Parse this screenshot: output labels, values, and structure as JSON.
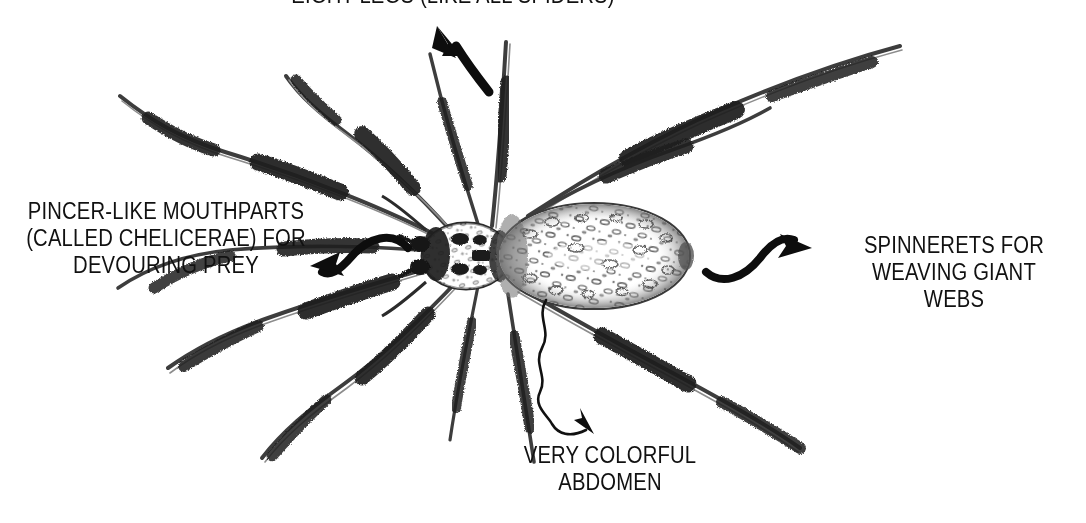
{
  "figure": {
    "subject": "spider",
    "background_color": "#ffffff",
    "ink_color": "#1a1a1a"
  },
  "annotations": [
    {
      "id": "eight-legs",
      "text": "EIGHT LEGS (LIKE ALL SPIDERS)",
      "position": "top",
      "clipped": "true",
      "arrow": "curved-arrow-up-left"
    },
    {
      "id": "chelicerae",
      "text": "PINCER-LIKE MOUTHPARTS\n(CALLED CHELICERAE) FOR\nDEVOURING PREY",
      "position": "left",
      "arrow": "s-curve-arrow-left"
    },
    {
      "id": "spinnerets",
      "text": "SPINNERETS FOR\nWEAVING GIANT WEBS",
      "position": "right",
      "arrow": "s-curve-arrow-right"
    },
    {
      "id": "abdomen",
      "text": "VERY COLORFUL\nABDOMEN",
      "position": "bottom",
      "arrow": "wavy-arrow-down-right"
    }
  ],
  "illustration": {
    "parts": [
      {
        "name": "cephalothorax",
        "description": "small dark mottled front body section"
      },
      {
        "name": "abdomen",
        "description": "large elongated oval with speckled markings"
      },
      {
        "name": "legs",
        "description": "eight long bristly legs with dark spiny segments"
      },
      {
        "name": "chelicerae",
        "description": "pincer-like mouthparts at front"
      },
      {
        "name": "spinnerets",
        "description": "at rear tip of abdomen"
      }
    ]
  }
}
